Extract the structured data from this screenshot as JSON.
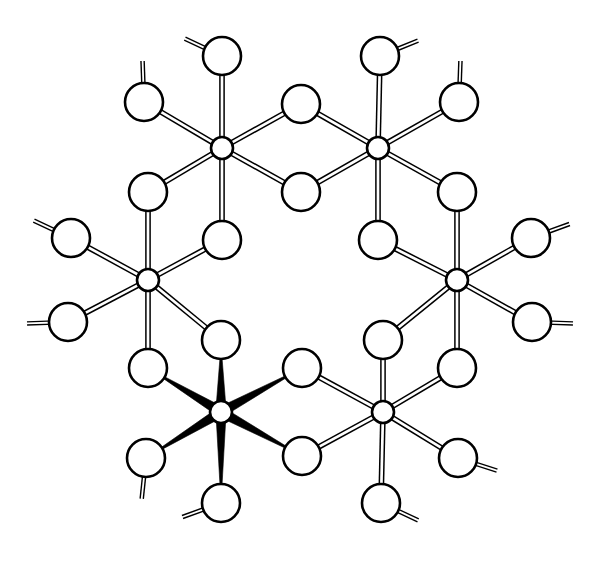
{
  "figure": {
    "background_color": "#ffffff",
    "line_color": "#000000",
    "fill_color": "#ffffff",
    "canvas": {
      "width": 599,
      "height": 568
    }
  },
  "style": {
    "metal_radius": 11,
    "ligand_radius": 19,
    "outline_width": 2.6,
    "hollow_bond_gap": 4.2,
    "hollow_bond_stroke": 1.5,
    "wedge_wide": 9.5,
    "wedge_narrow": 2.0,
    "tail_length": 22,
    "tail_gap": 3.2,
    "tail_stroke": 1.4
  },
  "metal_centers": [
    {
      "id": "M1",
      "label": "metal-center-top-left",
      "x": 222,
      "y": 148,
      "bond_style": "hollow"
    },
    {
      "id": "M2",
      "label": "metal-center-top-right",
      "x": 378,
      "y": 148,
      "bond_style": "hollow"
    },
    {
      "id": "M3",
      "label": "metal-center-left",
      "x": 148,
      "y": 280,
      "bond_style": "hollow"
    },
    {
      "id": "M4",
      "label": "metal-center-right",
      "x": 457,
      "y": 280,
      "bond_style": "hollow"
    },
    {
      "id": "M5",
      "label": "metal-center-bottom-left",
      "x": 221,
      "y": 412,
      "bond_style": "wedge"
    },
    {
      "id": "M6",
      "label": "metal-center-bottom-right",
      "x": 383,
      "y": 412,
      "bond_style": "hollow"
    }
  ],
  "bridging_ligands": [
    {
      "id": "B1",
      "label": "bridge-M1-M2-upper",
      "x": 301,
      "y": 104,
      "between": [
        "M1",
        "M2"
      ]
    },
    {
      "id": "B2",
      "label": "bridge-M1-M2-lower",
      "x": 301,
      "y": 192,
      "between": [
        "M1",
        "M2"
      ]
    },
    {
      "id": "B3",
      "label": "bridge-M1-M3-outer",
      "x": 148,
      "y": 192,
      "between": [
        "M1",
        "M3"
      ]
    },
    {
      "id": "B4",
      "label": "bridge-M1-M3-inner",
      "x": 222,
      "y": 240,
      "between": [
        "M1",
        "M3"
      ]
    },
    {
      "id": "B5",
      "label": "bridge-M2-M4-outer",
      "x": 457,
      "y": 192,
      "between": [
        "M2",
        "M4"
      ]
    },
    {
      "id": "B6",
      "label": "bridge-M2-M4-inner",
      "x": 378,
      "y": 240,
      "between": [
        "M2",
        "M4"
      ]
    },
    {
      "id": "B7",
      "label": "bridge-M3-M5-outer",
      "x": 148,
      "y": 368,
      "between": [
        "M3",
        "M5"
      ]
    },
    {
      "id": "B8",
      "label": "bridge-M3-M5-inner",
      "x": 221,
      "y": 340,
      "between": [
        "M3",
        "M5"
      ]
    },
    {
      "id": "B9",
      "label": "bridge-M4-M6-outer",
      "x": 457,
      "y": 368,
      "between": [
        "M4",
        "M6"
      ]
    },
    {
      "id": "B10",
      "label": "bridge-M4-M6-inner",
      "x": 383,
      "y": 340,
      "between": [
        "M4",
        "M6"
      ]
    },
    {
      "id": "B11",
      "label": "bridge-M5-M6-upper",
      "x": 302,
      "y": 368,
      "between": [
        "M5",
        "M6"
      ]
    },
    {
      "id": "B12",
      "label": "bridge-M5-M6-lower",
      "x": 302,
      "y": 456,
      "between": [
        "M5",
        "M6"
      ]
    }
  ],
  "terminal_ligands": [
    {
      "id": "T1",
      "label": "terminal-m1-up",
      "parent": "M1",
      "x": 222,
      "y": 56,
      "tail_angle": 205
    },
    {
      "id": "T2",
      "label": "terminal-m1-up-left",
      "parent": "M1",
      "x": 144,
      "y": 102,
      "tail_angle": 268
    },
    {
      "id": "T3",
      "label": "terminal-m2-up",
      "parent": "M2",
      "x": 380,
      "y": 56,
      "tail_angle": 338
    },
    {
      "id": "T4",
      "label": "terminal-m2-up-right",
      "parent": "M2",
      "x": 459,
      "y": 102,
      "tail_angle": 272
    },
    {
      "id": "T5",
      "label": "terminal-m3-up-left",
      "parent": "M3",
      "x": 71,
      "y": 238,
      "tail_angle": 205
    },
    {
      "id": "T6",
      "label": "terminal-m3-left",
      "parent": "M3",
      "x": 68,
      "y": 322,
      "tail_angle": 178
    },
    {
      "id": "T7",
      "label": "terminal-m4-up-right",
      "parent": "M4",
      "x": 531,
      "y": 238,
      "tail_angle": 340
    },
    {
      "id": "T8",
      "label": "terminal-m4-right",
      "parent": "M4",
      "x": 532,
      "y": 322,
      "tail_angle": 2
    },
    {
      "id": "T9",
      "label": "terminal-m5-low-left",
      "parent": "M5",
      "x": 146,
      "y": 458,
      "tail_angle": 96
    },
    {
      "id": "T10",
      "label": "terminal-m5-down",
      "parent": "M5",
      "x": 221,
      "y": 503,
      "tail_angle": 160
    },
    {
      "id": "T11",
      "label": "terminal-m6-low-right",
      "parent": "M6",
      "x": 458,
      "y": 458,
      "tail_angle": 18
    },
    {
      "id": "T12",
      "label": "terminal-m6-down",
      "parent": "M6",
      "x": 381,
      "y": 503,
      "tail_angle": 25
    }
  ],
  "bonds": [
    {
      "from": "M1",
      "to": "B1",
      "style": "hollow"
    },
    {
      "from": "M1",
      "to": "B2",
      "style": "hollow"
    },
    {
      "from": "M1",
      "to": "B3",
      "style": "hollow"
    },
    {
      "from": "M1",
      "to": "B4",
      "style": "hollow"
    },
    {
      "from": "M1",
      "to": "T1",
      "style": "hollow"
    },
    {
      "from": "M1",
      "to": "T2",
      "style": "hollow"
    },
    {
      "from": "M2",
      "to": "B1",
      "style": "hollow"
    },
    {
      "from": "M2",
      "to": "B2",
      "style": "hollow"
    },
    {
      "from": "M2",
      "to": "B5",
      "style": "hollow"
    },
    {
      "from": "M2",
      "to": "B6",
      "style": "hollow"
    },
    {
      "from": "M2",
      "to": "T3",
      "style": "hollow"
    },
    {
      "from": "M2",
      "to": "T4",
      "style": "hollow"
    },
    {
      "from": "M3",
      "to": "B3",
      "style": "hollow"
    },
    {
      "from": "M3",
      "to": "B4",
      "style": "hollow"
    },
    {
      "from": "M3",
      "to": "B7",
      "style": "hollow"
    },
    {
      "from": "M3",
      "to": "B8",
      "style": "hollow"
    },
    {
      "from": "M3",
      "to": "T5",
      "style": "hollow"
    },
    {
      "from": "M3",
      "to": "T6",
      "style": "hollow"
    },
    {
      "from": "M4",
      "to": "B5",
      "style": "hollow"
    },
    {
      "from": "M4",
      "to": "B6",
      "style": "hollow"
    },
    {
      "from": "M4",
      "to": "B9",
      "style": "hollow"
    },
    {
      "from": "M4",
      "to": "B10",
      "style": "hollow"
    },
    {
      "from": "M4",
      "to": "T7",
      "style": "hollow"
    },
    {
      "from": "M4",
      "to": "T8",
      "style": "hollow"
    },
    {
      "from": "M5",
      "to": "B7",
      "style": "wedge"
    },
    {
      "from": "M5",
      "to": "B8",
      "style": "wedge"
    },
    {
      "from": "M5",
      "to": "B11",
      "style": "wedge"
    },
    {
      "from": "M5",
      "to": "B12",
      "style": "wedge"
    },
    {
      "from": "M5",
      "to": "T9",
      "style": "wedge"
    },
    {
      "from": "M5",
      "to": "T10",
      "style": "wedge"
    },
    {
      "from": "M6",
      "to": "B9",
      "style": "hollow"
    },
    {
      "from": "M6",
      "to": "B10",
      "style": "hollow"
    },
    {
      "from": "M6",
      "to": "B11",
      "style": "hollow"
    },
    {
      "from": "M6",
      "to": "B12",
      "style": "hollow"
    },
    {
      "from": "M6",
      "to": "T11",
      "style": "hollow"
    },
    {
      "from": "M6",
      "to": "T12",
      "style": "hollow"
    }
  ]
}
